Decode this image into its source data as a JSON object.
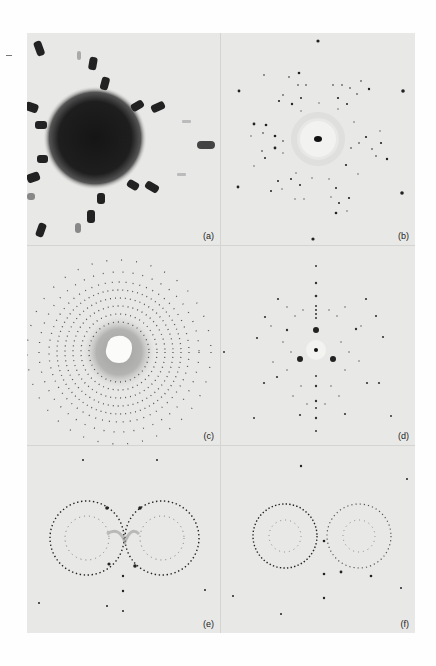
{
  "figure": {
    "layout": "2 columns x 3 rows",
    "background_color": "#e8e8e6",
    "spot_color": "#1a1a1a",
    "panels": [
      {
        "id": "a",
        "label": "(a)",
        "pattern": "dark-central-disk-with-radial-elongated-spots"
      },
      {
        "id": "b",
        "label": "(b)",
        "pattern": "sharp-spot-pattern-with-central-spot"
      },
      {
        "id": "c",
        "label": "(c)",
        "pattern": "dense-spot-lattice-with-bright-center"
      },
      {
        "id": "d",
        "label": "(d)",
        "pattern": "threefold-symmetric-spot-pattern"
      },
      {
        "id": "e",
        "label": "(e)",
        "pattern": "two-intersecting-spot-rings"
      },
      {
        "id": "f",
        "label": "(f)",
        "pattern": "two-intersecting-spot-rings"
      }
    ]
  }
}
